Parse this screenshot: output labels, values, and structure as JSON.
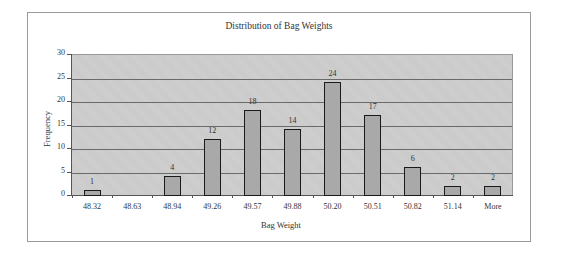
{
  "chart_data": {
    "type": "bar",
    "title": "Distribution of Bag Weights",
    "xlabel": "Bag Weight",
    "ylabel": "Frequency",
    "categories": [
      "48.32",
      "48.63",
      "48.94",
      "49.26",
      "49.57",
      "49.88",
      "50.20",
      "50.51",
      "50.82",
      "51.14",
      "More"
    ],
    "values": [
      1,
      0,
      4,
      12,
      18,
      14,
      24,
      17,
      6,
      2,
      2
    ],
    "data_labels": [
      "1",
      "",
      "4",
      "12",
      "18",
      "14",
      "24",
      "17",
      "6",
      "2",
      "2"
    ],
    "yticks": [
      "0",
      "5",
      "10",
      "15",
      "20",
      "25",
      "30"
    ],
    "ylim": [
      0,
      30
    ],
    "grid": true,
    "legend": "none",
    "colors": {
      "bar_fill": "#a9a9a9",
      "bar_border": "#1a1a1a",
      "plot_bg": "#c9c9c9",
      "gridline": "#6a6a6a"
    }
  }
}
